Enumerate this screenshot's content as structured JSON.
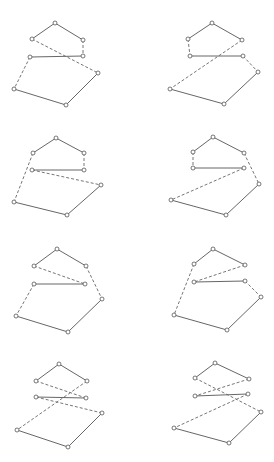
{
  "figure": {
    "caption": "",
    "colors": {
      "line": "#555555",
      "dashed": "#666666",
      "node_fill": "#ffffff"
    },
    "panels": [
      {
        "id": "panel-1",
        "nodes": [
          [
            55,
            23
          ],
          [
            32,
            39
          ],
          [
            83,
            40
          ],
          [
            30,
            57
          ],
          [
            83,
            56
          ],
          [
            98,
            73
          ],
          [
            14,
            89
          ],
          [
            66,
            105
          ]
        ],
        "solid": [
          [
            0,
            1
          ],
          [
            0,
            2
          ],
          [
            3,
            4
          ],
          [
            5,
            7
          ],
          [
            6,
            7
          ]
        ],
        "dashed": [
          [
            2,
            4
          ],
          [
            1,
            5
          ],
          [
            3,
            6
          ]
        ]
      },
      {
        "id": "panel-2",
        "nodes": [
          [
            212,
            23
          ],
          [
            188,
            39
          ],
          [
            242,
            40
          ],
          [
            190,
            56
          ],
          [
            243,
            56
          ],
          [
            258,
            72
          ],
          [
            170,
            89
          ],
          [
            224,
            104
          ]
        ],
        "solid": [
          [
            0,
            1
          ],
          [
            0,
            2
          ],
          [
            3,
            4
          ],
          [
            5,
            7
          ],
          [
            6,
            7
          ]
        ],
        "dashed": [
          [
            1,
            3
          ],
          [
            2,
            6
          ],
          [
            4,
            5
          ]
        ]
      },
      {
        "id": "panel-3",
        "nodes": [
          [
            56,
            138
          ],
          [
            33,
            153
          ],
          [
            84,
            153
          ],
          [
            32,
            170
          ],
          [
            84,
            170
          ],
          [
            101,
            185
          ],
          [
            14,
            202
          ],
          [
            67,
            215
          ]
        ],
        "solid": [
          [
            0,
            1
          ],
          [
            0,
            2
          ],
          [
            3,
            4
          ],
          [
            5,
            7
          ],
          [
            6,
            7
          ]
        ],
        "dashed": [
          [
            2,
            4
          ],
          [
            1,
            6
          ],
          [
            3,
            5
          ]
        ]
      },
      {
        "id": "panel-4",
        "nodes": [
          [
            213,
            137
          ],
          [
            193,
            152
          ],
          [
            244,
            153
          ],
          [
            193,
            168
          ],
          [
            244,
            168
          ],
          [
            259,
            184
          ],
          [
            171,
            200
          ],
          [
            226,
            215
          ]
        ],
        "solid": [
          [
            0,
            1
          ],
          [
            0,
            2
          ],
          [
            3,
            4
          ],
          [
            5,
            7
          ],
          [
            6,
            7
          ]
        ],
        "dashed": [
          [
            1,
            3
          ],
          [
            2,
            5
          ],
          [
            4,
            6
          ]
        ]
      },
      {
        "id": "panel-5",
        "nodes": [
          [
            57,
            249
          ],
          [
            34,
            266
          ],
          [
            86,
            266
          ],
          [
            34,
            284
          ],
          [
            85,
            284
          ],
          [
            102,
            299
          ],
          [
            16,
            316
          ],
          [
            68,
            332
          ]
        ],
        "solid": [
          [
            0,
            1
          ],
          [
            0,
            2
          ],
          [
            3,
            4
          ],
          [
            5,
            7
          ],
          [
            6,
            7
          ]
        ],
        "dashed": [
          [
            1,
            4
          ],
          [
            2,
            5
          ],
          [
            3,
            6
          ]
        ]
      },
      {
        "id": "panel-6",
        "nodes": [
          [
            213,
            249
          ],
          [
            194,
            264
          ],
          [
            245,
            265
          ],
          [
            194,
            282
          ],
          [
            245,
            281
          ],
          [
            261,
            297
          ],
          [
            174,
            315
          ],
          [
            227,
            330
          ]
        ],
        "solid": [
          [
            0,
            1
          ],
          [
            0,
            2
          ],
          [
            3,
            4
          ],
          [
            5,
            7
          ],
          [
            6,
            7
          ]
        ],
        "dashed": [
          [
            1,
            6
          ],
          [
            2,
            3
          ],
          [
            4,
            5
          ]
        ]
      },
      {
        "id": "panel-7",
        "nodes": [
          [
            59,
            364
          ],
          [
            36,
            381
          ],
          [
            87,
            381
          ],
          [
            36,
            397
          ],
          [
            86,
            398
          ],
          [
            102,
            413
          ],
          [
            17,
            430
          ],
          [
            68,
            447
          ]
        ],
        "solid": [
          [
            0,
            1
          ],
          [
            0,
            2
          ],
          [
            3,
            4
          ],
          [
            5,
            7
          ],
          [
            6,
            7
          ]
        ],
        "dashed": [
          [
            1,
            4
          ],
          [
            2,
            6
          ],
          [
            3,
            5
          ]
        ]
      },
      {
        "id": "panel-8",
        "nodes": [
          [
            215,
            363
          ],
          [
            195,
            378
          ],
          [
            249,
            379
          ],
          [
            195,
            396
          ],
          [
            248,
            394
          ],
          [
            261,
            412
          ],
          [
            174,
            428
          ],
          [
            229,
            443
          ]
        ],
        "solid": [
          [
            0,
            1
          ],
          [
            0,
            2
          ],
          [
            3,
            4
          ],
          [
            5,
            7
          ],
          [
            6,
            7
          ]
        ],
        "dashed": [
          [
            1,
            5
          ],
          [
            2,
            3
          ],
          [
            4,
            6
          ]
        ]
      }
    ]
  }
}
